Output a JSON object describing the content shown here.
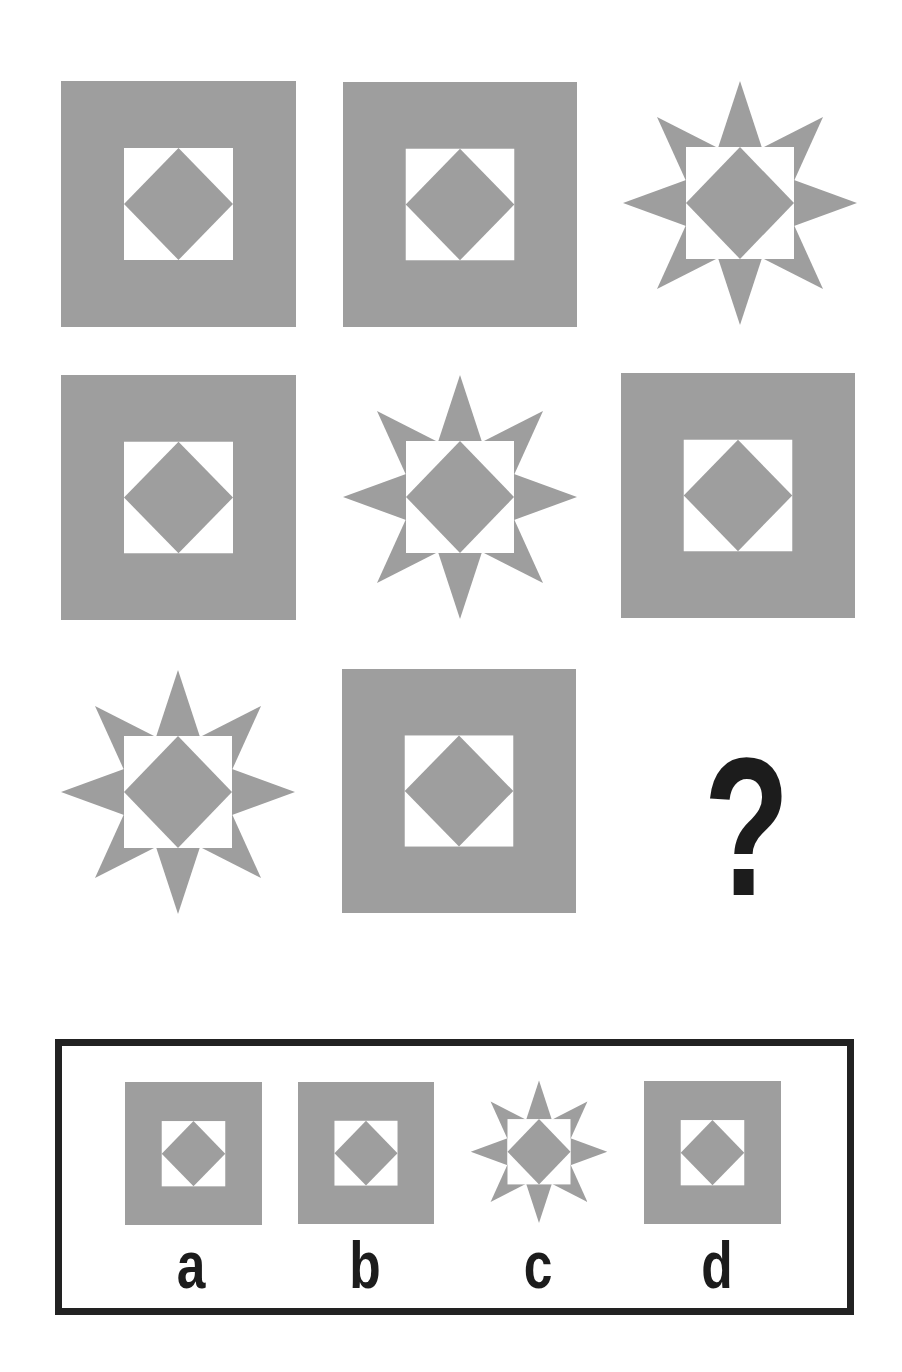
{
  "colors": {
    "shape_gray": "#9e9e9e",
    "window_white": "#ffffff",
    "ink": "#1c1c1c",
    "frame": "#222222"
  },
  "puzzle": {
    "grid": [
      {
        "row": 1,
        "col": 1,
        "type": "square",
        "x": 61,
        "y": 81,
        "w": 235,
        "h": 246
      },
      {
        "row": 1,
        "col": 2,
        "type": "square",
        "x": 343,
        "y": 82,
        "w": 234,
        "h": 245
      },
      {
        "row": 1,
        "col": 3,
        "type": "star",
        "x": 620,
        "y": 80,
        "w": 240,
        "h": 246
      },
      {
        "row": 2,
        "col": 1,
        "type": "square",
        "x": 61,
        "y": 375,
        "w": 235,
        "h": 245
      },
      {
        "row": 2,
        "col": 2,
        "type": "star",
        "x": 340,
        "y": 374,
        "w": 240,
        "h": 246
      },
      {
        "row": 2,
        "col": 3,
        "type": "square",
        "x": 621,
        "y": 373,
        "w": 234,
        "h": 245
      },
      {
        "row": 3,
        "col": 1,
        "type": "star",
        "x": 58,
        "y": 669,
        "w": 240,
        "h": 246
      },
      {
        "row": 3,
        "col": 2,
        "type": "square",
        "x": 342,
        "y": 669,
        "w": 234,
        "h": 244
      },
      {
        "row": 3,
        "col": 3,
        "type": "missing",
        "symbol": "?"
      }
    ],
    "question_mark": {
      "text": "?",
      "x": 690,
      "y": 730,
      "w": 96,
      "font_size": 196
    }
  },
  "answers": {
    "box": {
      "x": 55,
      "y": 1039,
      "w": 799,
      "h": 276
    },
    "options": [
      {
        "label": "a",
        "type": "square",
        "x": 125,
        "y": 1082,
        "w": 137,
        "h": 142,
        "label_x": 191
      },
      {
        "label": "b",
        "type": "square",
        "x": 298,
        "y": 1082,
        "w": 136,
        "h": 142,
        "label_x": 365
      },
      {
        "label": "c",
        "type": "star",
        "x": 469,
        "y": 1080,
        "w": 140,
        "h": 145,
        "label_x": 538
      },
      {
        "label": "d",
        "type": "square",
        "x": 644,
        "y": 1081,
        "w": 137,
        "h": 142,
        "label_x": 717
      }
    ],
    "label_top": 1232,
    "label_font_size": 66
  }
}
